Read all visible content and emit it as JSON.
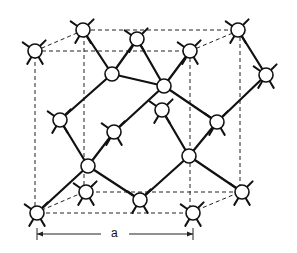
{
  "figure": {
    "dimension_label": "a",
    "dimension_label_position": {
      "x": 106,
      "y": 234
    }
  },
  "cell": {
    "front_face": {
      "x1": 35,
      "y1": 51,
      "x2": 190,
      "y2": 213
    },
    "back_face": {
      "x1": 84,
      "y1": 30,
      "x2": 240,
      "y2": 192
    }
  },
  "atoms": [
    {
      "id": "corner-top-front-left",
      "x": 35,
      "y": 51,
      "r": 7,
      "stubs": true
    },
    {
      "id": "corner-top-back-left",
      "x": 83,
      "y": 30,
      "r": 7,
      "stubs": true
    },
    {
      "id": "corner-top-back-right",
      "x": 238,
      "y": 30,
      "r": 7,
      "stubs": true
    },
    {
      "id": "corner-top-front-right",
      "x": 190,
      "y": 51,
      "r": 7,
      "stubs": true
    },
    {
      "id": "face-top",
      "x": 137,
      "y": 39,
      "r": 7,
      "stubs": true
    },
    {
      "id": "face-right",
      "x": 266,
      "y": 75,
      "r": 7,
      "stubs": true
    },
    {
      "id": "interior-upper-left",
      "x": 112,
      "y": 74,
      "r": 7,
      "stubs": false
    },
    {
      "id": "interior-upper-right",
      "x": 164,
      "y": 86,
      "r": 7,
      "stubs": false
    },
    {
      "id": "face-left",
      "x": 60,
      "y": 120,
      "r": 7,
      "stubs": true
    },
    {
      "id": "interior-mid-back",
      "x": 162,
      "y": 110,
      "r": 7,
      "stubs": true
    },
    {
      "id": "face-right-mid",
      "x": 217,
      "y": 122,
      "r": 7,
      "stubs": true
    },
    {
      "id": "interior-center",
      "x": 114,
      "y": 132,
      "r": 7,
      "stubs": true
    },
    {
      "id": "interior-lower-right",
      "x": 189,
      "y": 156,
      "r": 7,
      "stubs": false
    },
    {
      "id": "interior-lower-left",
      "x": 88,
      "y": 166,
      "r": 7,
      "stubs": false
    },
    {
      "id": "corner-bottom-back-left",
      "x": 86,
      "y": 192,
      "r": 7,
      "stubs": true
    },
    {
      "id": "face-bottom",
      "x": 140,
      "y": 200,
      "r": 7,
      "stubs": true
    },
    {
      "id": "corner-bottom-back-right",
      "x": 242,
      "y": 192,
      "r": 7,
      "stubs": true
    },
    {
      "id": "corner-bottom-front-left",
      "x": 37,
      "y": 213,
      "r": 7,
      "stubs": true
    },
    {
      "id": "corner-bottom-front-right",
      "x": 193,
      "y": 213,
      "r": 7,
      "stubs": true
    }
  ],
  "bonds": [
    [
      "corner-top-back-left",
      "interior-upper-left"
    ],
    [
      "interior-upper-left",
      "face-top"
    ],
    [
      "interior-upper-left",
      "face-left"
    ],
    [
      "interior-upper-left",
      "interior-upper-right"
    ],
    [
      "face-top",
      "interior-upper-right"
    ],
    [
      "corner-top-front-right",
      "interior-upper-right"
    ],
    [
      "corner-top-back-right",
      "face-right"
    ],
    [
      "face-right",
      "face-right-mid"
    ],
    [
      "interior-upper-right",
      "face-right-mid"
    ],
    [
      "face-right-mid",
      "interior-lower-right"
    ],
    [
      "interior-mid-back",
      "interior-lower-right"
    ],
    [
      "interior-center",
      "interior-upper-right"
    ],
    [
      "interior-center",
      "interior-lower-left"
    ],
    [
      "face-left",
      "interior-lower-left"
    ],
    [
      "interior-lower-left",
      "corner-bottom-front-left"
    ],
    [
      "interior-lower-left",
      "face-bottom"
    ],
    [
      "interior-lower-right",
      "face-bottom"
    ],
    [
      "interior-lower-right",
      "corner-bottom-back-right"
    ]
  ],
  "dimension": {
    "x1": 37,
    "x2": 193,
    "y": 234
  }
}
